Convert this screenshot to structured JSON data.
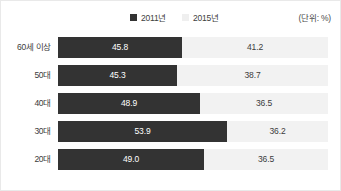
{
  "legend": {
    "items": [
      {
        "label": "2011년",
        "color": "#333333",
        "swatch_name": "legend-swatch-2011"
      },
      {
        "label": "2015년",
        "color": "#efefef",
        "swatch_name": "legend-swatch-2015"
      }
    ]
  },
  "unit_label": "(단위: %)",
  "chart_data": {
    "type": "bar",
    "orientation": "horizontal",
    "stacked": true,
    "title": "",
    "subtitle": "",
    "xlabel": "",
    "ylabel": "",
    "unit": "%",
    "unit_note": "(단위: %)",
    "grid": false,
    "legend_position": "top-center",
    "categories": [
      "60세 이상",
      "50대",
      "40대",
      "30대",
      "20대"
    ],
    "series": [
      {
        "name": "2011년",
        "color": "#333333",
        "values": [
          45.8,
          45.3,
          48.9,
          53.9,
          49.0
        ]
      },
      {
        "name": "2015년",
        "color": "#efefef",
        "values": [
          41.2,
          38.7,
          36.5,
          36.2,
          36.5
        ]
      }
    ],
    "rows": [
      {
        "category": "60세 이상",
        "v2011": "45.8",
        "v2015": "41.2",
        "bar_pct": 45.8
      },
      {
        "category": "50대",
        "v2011": "45.3",
        "v2015": "38.7",
        "bar_pct": 44.1
      },
      {
        "category": "40대",
        "v2011": "48.9",
        "v2015": "36.5",
        "bar_pct": 52.6
      },
      {
        "category": "30대",
        "v2011": "53.9",
        "v2015": "36.2",
        "bar_pct": 62.6
      },
      {
        "category": "20대",
        "v2011": "49.0",
        "v2015": "36.5",
        "bar_pct": 54.1
      }
    ],
    "xlim": [
      0,
      100
    ]
  }
}
